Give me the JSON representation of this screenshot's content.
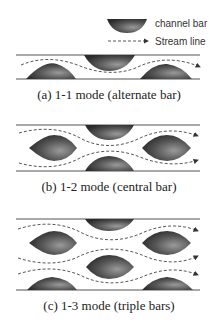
{
  "legend": {
    "bar_label": "channel bar",
    "stream_label": "Stream line"
  },
  "panels": [
    {
      "id": "a",
      "caption": "(a) 1-1 mode (alternate bar)"
    },
    {
      "id": "b",
      "caption": "(b) 1-2 mode (central bar)"
    },
    {
      "id": "c",
      "caption": "(c) 1-3 mode (triple bars)"
    }
  ],
  "colors": {
    "bar_dark": "#2a2a2a",
    "bar_light": "#9a9a9a",
    "bank": "#555555",
    "stream": "#444444"
  }
}
